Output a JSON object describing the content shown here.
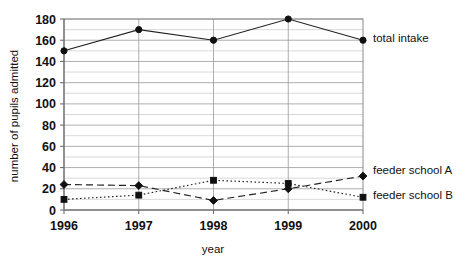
{
  "chart_data": {
    "type": "line",
    "title": "",
    "xlabel": "year",
    "ylabel": "number of pupils admitted",
    "categories": [
      "1996",
      "1997",
      "1998",
      "1999",
      "2000"
    ],
    "x": [
      1996,
      1997,
      1998,
      1999,
      2000
    ],
    "ylim": [
      0,
      180
    ],
    "xlim": [
      1996,
      2000
    ],
    "y_ticks": [
      0,
      20,
      40,
      60,
      80,
      100,
      120,
      140,
      160,
      180
    ],
    "y_minor_step": 10,
    "grid": "horizontal",
    "legend_position": "right-of-plot-inline",
    "series": [
      {
        "name": "total intake",
        "values": [
          150,
          170,
          160,
          180,
          160
        ],
        "style": "solid",
        "marker": "circle",
        "color": "#101010",
        "label_y_value": 162
      },
      {
        "name": "feeder school A",
        "values": [
          24,
          23,
          9,
          20,
          32
        ],
        "style": "dashed",
        "marker": "diamond",
        "color": "#101010",
        "label_y_value": 38
      },
      {
        "name": "feeder school B",
        "values": [
          10,
          14,
          28,
          25,
          12
        ],
        "style": "dotted",
        "marker": "square",
        "color": "#101010",
        "label_y_value": 14
      }
    ]
  },
  "axis": {
    "y_tick_labels": [
      "0",
      "20",
      "40",
      "60",
      "80",
      "100",
      "120",
      "140",
      "160",
      "180"
    ],
    "x_tick_labels": [
      "1996",
      "1997",
      "1998",
      "1999",
      "2000"
    ],
    "x_title": "year",
    "y_title": "number of pupils admitted"
  },
  "labels": {
    "total_intake": "total intake",
    "feeder_school_a": "feeder school A",
    "feeder_school_b": "feeder school B"
  }
}
